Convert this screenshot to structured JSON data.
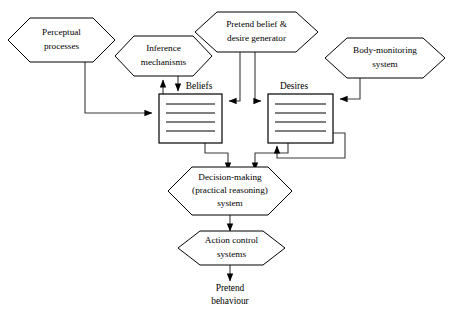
{
  "diagram": {
    "background_color": "#ffffff",
    "line_color": "#3a3a3a",
    "text_color": "#000000",
    "nodes": {
      "perceptual": {
        "label_line1": "Perceptual",
        "label_line2": "processes",
        "shape": "hexagon"
      },
      "inference": {
        "label_line1": "Inference",
        "label_line2": "mechanisms",
        "shape": "hexagon"
      },
      "pretend_generator": {
        "label_line1": "Pretend belief &",
        "label_line2": "desire generator",
        "shape": "hexagon"
      },
      "body_monitoring": {
        "label_line1": "Body-monitoring",
        "label_line2": "system",
        "shape": "hexagon"
      },
      "beliefs": {
        "label": "Beliefs",
        "shape": "store-box",
        "line_count": 4
      },
      "desires": {
        "label": "Desires",
        "shape": "store-box",
        "line_count": 4
      },
      "decision_making": {
        "label_line1": "Decision-making",
        "label_line2": "(practical reasoning)",
        "label_line3": "system",
        "shape": "hexagon"
      },
      "action_control": {
        "label_line1": "Action control",
        "label_line2": "systems",
        "shape": "hexagon"
      },
      "pretend_behaviour": {
        "label_line1": "Pretend",
        "label_line2": "behaviour",
        "shape": "text-terminal"
      }
    },
    "connections": [
      {
        "name": "perceptual-to-beliefs",
        "from": "perceptual",
        "to": "beliefs",
        "arrow": "to"
      },
      {
        "name": "beliefs-to-inference",
        "from": "beliefs",
        "to": "inference",
        "arrow": "to"
      },
      {
        "name": "inference-to-beliefs",
        "from": "inference",
        "to": "beliefs",
        "arrow": "to"
      },
      {
        "name": "generator-to-beliefs",
        "from": "pretend_generator",
        "to": "beliefs",
        "arrow": "to"
      },
      {
        "name": "generator-to-desires",
        "from": "pretend_generator",
        "to": "desires",
        "arrow": "to"
      },
      {
        "name": "body-monitoring-to-desires",
        "from": "body_monitoring",
        "to": "desires",
        "arrow": "to"
      },
      {
        "name": "beliefs-to-decision",
        "from": "beliefs",
        "to": "decision_making",
        "arrow": "to"
      },
      {
        "name": "desires-to-decision",
        "from": "desires",
        "to": "decision_making",
        "arrow": "to"
      },
      {
        "name": "desires-feedback-loop",
        "from": "desires",
        "to": "desires",
        "arrow": "to"
      },
      {
        "name": "decision-to-action-control",
        "from": "decision_making",
        "to": "action_control",
        "arrow": "to"
      },
      {
        "name": "action-control-to-pretend-behaviour",
        "from": "action_control",
        "to": "pretend_behaviour",
        "arrow": "to"
      }
    ]
  }
}
